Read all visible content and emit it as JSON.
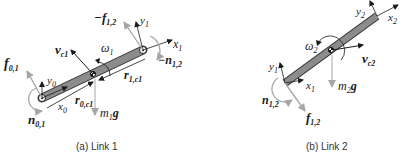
{
  "figure": {
    "panels": [
      {
        "id": "link1",
        "caption": "(a) Link 1",
        "labels": {
          "f01": {
            "main": "f",
            "sub": "0,1"
          },
          "n01": {
            "main": "n",
            "sub": "0,1"
          },
          "y0": {
            "main": "y",
            "sub": "0"
          },
          "x0": {
            "main": "x",
            "sub": "0"
          },
          "r0c1": {
            "main": "r",
            "sub": "0,c1"
          },
          "m1g": {
            "main": "m",
            "sub": "1",
            "tail": "g"
          },
          "vc1": {
            "main": "v",
            "sub": "c1"
          },
          "w1": {
            "main": "ω",
            "sub": "1"
          },
          "r1c1": {
            "main": "r",
            "sub": "1,c1"
          },
          "mf12": {
            "main": "−f",
            "sub": "1,2"
          },
          "y1": {
            "main": "y",
            "sub": "1"
          },
          "x1": {
            "main": "x",
            "sub": "1"
          },
          "mn12": {
            "main": "−n",
            "sub": "1,2"
          }
        }
      },
      {
        "id": "link2",
        "caption": "(b) Link 2",
        "labels": {
          "y2": {
            "main": "y",
            "sub": "2"
          },
          "x2": {
            "main": "x",
            "sub": "2"
          },
          "w2": {
            "main": "ω",
            "sub": "2"
          },
          "vc2": {
            "main": "v",
            "sub": "c2"
          },
          "y1": {
            "main": "y",
            "sub": "1"
          },
          "x1": {
            "main": "x",
            "sub": "1"
          },
          "m2g": {
            "main": "m",
            "sub": "2",
            "tail": "g"
          },
          "n12": {
            "main": "n",
            "sub": "1,2"
          },
          "f12": {
            "main": "f",
            "sub": "1,2"
          }
        }
      }
    ],
    "colors": {
      "link_fill": "#8c8c8c",
      "link_stroke": "#333333",
      "force_arrow": "#a6a6a6",
      "frame_arrow": "#1a1a1a"
    }
  }
}
